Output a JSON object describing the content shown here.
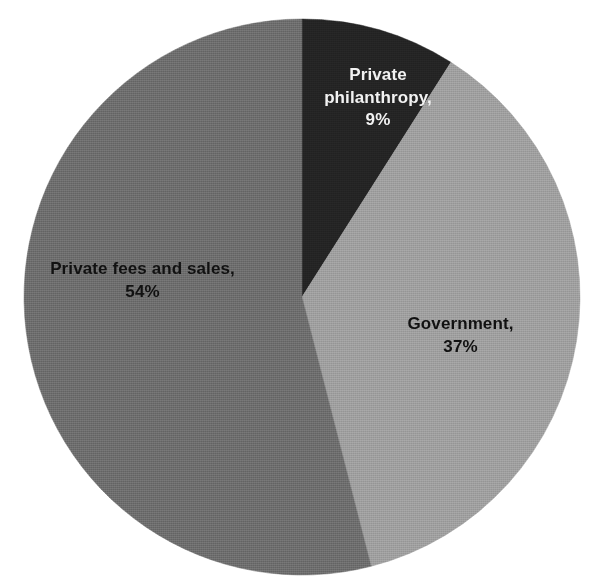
{
  "chart_data": {
    "type": "pie",
    "title": "",
    "subtitle": "",
    "xlabel": "",
    "ylabel": "",
    "legend_position": "none",
    "grid": false,
    "units": "percent",
    "start_angle_deg": 0,
    "direction": "clockwise",
    "categories": [
      "Private philanthropy",
      "Government",
      "Private fees and sales"
    ],
    "values": [
      9,
      37,
      54
    ],
    "value_labels": [
      "9%",
      "37%",
      "54%"
    ],
    "slices": [
      {
        "name": "Private philanthropy",
        "value": 9,
        "value_label": "9%",
        "label_text": "Private\nphilanthropy,\n9%",
        "color": "#232323",
        "label_color": "#f2f2f2",
        "start_angle_deg": 0,
        "end_angle_deg": 32.4
      },
      {
        "name": "Government",
        "value": 37,
        "value_label": "37%",
        "label_text": "Government,\n37%",
        "color": "#9c9c9c",
        "label_color": "#111111",
        "start_angle_deg": 32.4,
        "end_angle_deg": 165.6
      },
      {
        "name": "Private fees and sales",
        "value": 54,
        "value_label": "54%",
        "label_text": "Private fees and sales,\n54%",
        "color": "#6a6a6a",
        "label_color": "#111111",
        "start_angle_deg": 165.6,
        "end_angle_deg": 360
      }
    ]
  },
  "figure": {
    "background_color": "#ffffff",
    "center_x": 302,
    "center_y": 297,
    "radius": 278
  }
}
